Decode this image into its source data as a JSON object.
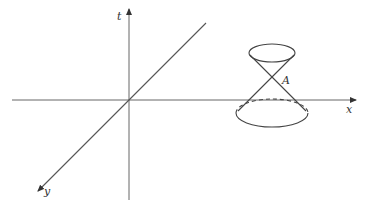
{
  "diagram": {
    "axes": {
      "t_label": "t",
      "x_label": "x",
      "y_label": "y"
    },
    "point_label": "A",
    "colors": {
      "line": "#555555",
      "text": "#333333",
      "background": "#ffffff"
    }
  }
}
